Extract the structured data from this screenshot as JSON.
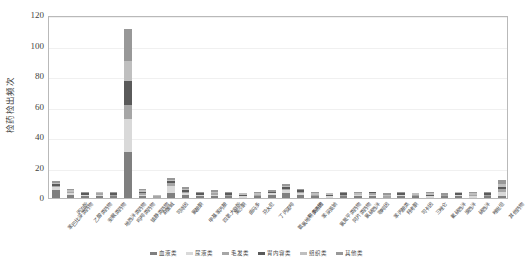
{
  "chart_data": {
    "type": "bar",
    "stacked": true,
    "title": "",
    "xlabel": "",
    "ylabel": "检药检出频次",
    "ylim": [
      0,
      120
    ],
    "yticks": [
      0,
      20,
      40,
      60,
      80,
      100,
      120
    ],
    "grid": true,
    "legend_position": "bottom",
    "categories": [
      "苯巴比妥类药物",
      "丙泊酚",
      "乙醇类药物",
      "安眠类药物",
      "地西泮类药物",
      "吗啡类药物",
      "镇静类药物",
      "麻黄碱",
      "可待因",
      "氯胺酮",
      "甲基苯丙胺",
      "四氢大麻酚",
      "美沙酮",
      "曲马多",
      "芬太尼",
      "丁丙诺啡",
      "氨氯地平类药物",
      "利多卡因",
      "苯妥英钠",
      "氯氮平类药物",
      "阿片类药物",
      "氯硝西泮",
      "咖啡因",
      "苯丙胺类",
      "羟考酮",
      "可卡因",
      "三唑仑",
      "氟硝西泮",
      "溴西泮",
      "硝西泮",
      "唑吡坦",
      "其他药物"
    ],
    "series": [
      {
        "name": "血液类",
        "color": "#7f7f7f",
        "values": [
          5,
          2,
          1,
          1,
          1,
          30,
          1,
          0,
          3,
          2,
          1,
          1,
          1,
          0,
          1,
          2,
          3,
          2,
          1,
          0,
          1,
          1,
          1,
          0,
          1,
          1,
          0,
          1,
          1,
          0,
          1,
          1
        ]
      },
      {
        "name": "尿液类",
        "color": "#d9d9d9",
        "values": [
          2,
          1,
          1,
          1,
          0,
          22,
          1,
          0,
          5,
          1,
          1,
          1,
          0,
          1,
          0,
          1,
          2,
          1,
          0,
          1,
          0,
          1,
          1,
          0,
          1,
          0,
          1,
          0,
          1,
          1,
          0,
          3
        ]
      },
      {
        "name": "毛发类",
        "color": "#a6a6a6",
        "values": [
          1,
          1,
          0,
          1,
          1,
          9,
          1,
          1,
          2,
          1,
          0,
          1,
          1,
          0,
          1,
          0,
          1,
          1,
          1,
          0,
          1,
          0,
          1,
          1,
          0,
          1,
          0,
          1,
          0,
          1,
          1,
          2
        ]
      },
      {
        "name": "胃内容类",
        "color": "#5a5a5a",
        "values": [
          1,
          0,
          1,
          0,
          1,
          16,
          1,
          0,
          1,
          1,
          1,
          0,
          1,
          1,
          0,
          1,
          1,
          1,
          0,
          1,
          1,
          0,
          1,
          0,
          1,
          0,
          1,
          0,
          1,
          0,
          1,
          1
        ]
      },
      {
        "name": "组织类",
        "color": "#bfbfbf",
        "values": [
          1,
          1,
          0,
          1,
          0,
          13,
          1,
          1,
          1,
          1,
          0,
          1,
          0,
          1,
          1,
          0,
          1,
          0,
          1,
          1,
          0,
          1,
          0,
          1,
          0,
          1,
          1,
          0,
          1,
          1,
          0,
          2
        ]
      },
      {
        "name": "其他类",
        "color": "#989898",
        "values": [
          1,
          1,
          1,
          0,
          1,
          21,
          1,
          0,
          1,
          1,
          1,
          1,
          1,
          0,
          1,
          1,
          1,
          1,
          1,
          0,
          1,
          1,
          0,
          1,
          1,
          0,
          1,
          1,
          0,
          1,
          1,
          3
        ]
      }
    ],
    "segment_labels": {
      "2": [
        "30",
        "22",
        "9",
        "16",
        "13",
        "21"
      ]
    },
    "totals": [
      11,
      6,
      4,
      4,
      4,
      111,
      6,
      2,
      13,
      7,
      4,
      5,
      4,
      3,
      4,
      5,
      9,
      6,
      4,
      3,
      4,
      4,
      4,
      3,
      4,
      3,
      4,
      3,
      4,
      4,
      4,
      12
    ]
  }
}
